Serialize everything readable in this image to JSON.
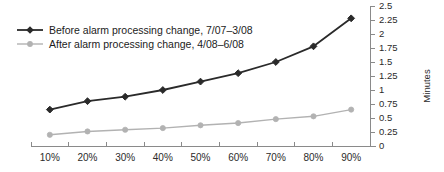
{
  "chart_data": {
    "type": "line",
    "title": "",
    "subtitle": "",
    "xlabel": "",
    "ylabel": "Minutes",
    "categories": [
      "10%",
      "20%",
      "30%",
      "40%",
      "50%",
      "60%",
      "70%",
      "80%",
      "90%"
    ],
    "ylim": [
      0,
      2.5
    ],
    "ytick_labels": [
      "0",
      "0.25",
      "0.5",
      "0.75",
      "1",
      "1.25",
      "1.5",
      "1.75",
      "2",
      "2.25",
      "2.5"
    ],
    "ytick_values": [
      0,
      0.25,
      0.5,
      0.75,
      1,
      1.25,
      1.5,
      1.75,
      2,
      2.25,
      2.5
    ],
    "grid": false,
    "legend_position": "top-left",
    "y_axis_side": "right",
    "series": [
      {
        "name": "Before alarm processing change, 7/07–3/08",
        "color": "#2a2a2a",
        "marker": "diamond",
        "values": [
          0.65,
          0.8,
          0.88,
          1.0,
          1.15,
          1.3,
          1.5,
          1.78,
          2.28
        ]
      },
      {
        "name": "After alarm processing change, 4/08–6/08",
        "color": "#b2b2b2",
        "marker": "circle",
        "values": [
          0.2,
          0.26,
          0.29,
          0.32,
          0.37,
          0.41,
          0.48,
          0.53,
          0.65
        ]
      }
    ]
  },
  "legend": {
    "items": [
      {
        "label": "Before alarm processing change, 7/07–3/08"
      },
      {
        "label": "After alarm processing change, 4/08–6/08"
      }
    ]
  },
  "axes": {
    "y_title": "Minutes",
    "y_labels": [
      "2.5",
      "2.25",
      "2",
      "1.75",
      "1.5",
      "1.25",
      "1",
      "0.75",
      "0.5",
      "0.25",
      "0"
    ],
    "x_labels": [
      "10%",
      "20%",
      "30%",
      "40%",
      "50%",
      "60%",
      "70%",
      "80%",
      "90%"
    ]
  },
  "colors": {
    "series_before": "#2a2a2a",
    "series_after": "#b2b2b2",
    "axis": "#8a8a8a",
    "text": "#2b2b2b",
    "background": "#ffffff"
  }
}
